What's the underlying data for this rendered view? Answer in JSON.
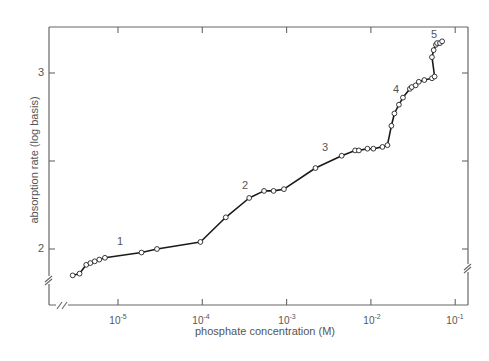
{
  "chart_data": {
    "type": "line",
    "title": "",
    "xlabel": "phosphate concentration (M)",
    "ylabel": "absorption rate (log basis)",
    "x_scale": "log",
    "x_ticks": [
      {
        "base": "10",
        "exp": "-5",
        "value": 1e-05
      },
      {
        "base": "10",
        "exp": "-4",
        "value": 0.0001
      },
      {
        "base": "10",
        "exp": "-3",
        "value": 0.001
      },
      {
        "base": "10",
        "exp": "-2",
        "value": 0.01
      },
      {
        "base": "10",
        "exp": "-1",
        "value": 0.1
      }
    ],
    "y_ticks": [
      {
        "label": "2",
        "value": 2
      },
      {
        "label": "",
        "value": 2.5
      },
      {
        "label": "3",
        "value": 3
      }
    ],
    "xlim": [
      2.3e-06,
      0.13
    ],
    "ylim": [
      1.68,
      3.26
    ],
    "axis_breaks": [
      "x-axis near left origin",
      "y-axis near bottom (left)",
      "y-axis near bottom (right)"
    ],
    "grid": false,
    "legend": null,
    "region_labels": [
      {
        "label": "1",
        "x": 1e-05,
        "y": 2.04
      },
      {
        "label": "2",
        "x": 0.00034,
        "y": 2.36
      },
      {
        "label": "3",
        "x": 0.0038,
        "y": 2.58
      },
      {
        "label": "4",
        "x": 0.026,
        "y": 2.91
      },
      {
        "label": "5",
        "x": 0.057,
        "y": 3.24
      }
    ],
    "series": [
      {
        "name": "absorption rate",
        "marker": "open circle",
        "points": [
          {
            "x": 2.9e-06,
            "y": 1.85
          },
          {
            "x": 3.5e-06,
            "y": 1.86
          },
          {
            "x": 4.2e-06,
            "y": 1.91
          },
          {
            "x": 4.7e-06,
            "y": 1.92
          },
          {
            "x": 5.3e-06,
            "y": 1.93
          },
          {
            "x": 6e-06,
            "y": 1.94
          },
          {
            "x": 7e-06,
            "y": 1.95
          },
          {
            "x": 1.9e-05,
            "y": 1.98
          },
          {
            "x": 2.9e-05,
            "y": 2.0
          },
          {
            "x": 9.5e-05,
            "y": 2.04
          },
          {
            "x": 0.00019,
            "y": 2.18
          },
          {
            "x": 0.00036,
            "y": 2.29
          },
          {
            "x": 0.00054,
            "y": 2.33
          },
          {
            "x": 0.0007,
            "y": 2.33
          },
          {
            "x": 0.00093,
            "y": 2.34
          },
          {
            "x": 0.0022,
            "y": 2.46
          },
          {
            "x": 0.0045,
            "y": 2.53
          },
          {
            "x": 0.0065,
            "y": 2.56
          },
          {
            "x": 0.0072,
            "y": 2.56
          },
          {
            "x": 0.0091,
            "y": 2.57
          },
          {
            "x": 0.0107,
            "y": 2.57
          },
          {
            "x": 0.0137,
            "y": 2.58
          },
          {
            "x": 0.0157,
            "y": 2.59
          },
          {
            "x": 0.0175,
            "y": 2.7
          },
          {
            "x": 0.019,
            "y": 2.77
          },
          {
            "x": 0.0215,
            "y": 2.82
          },
          {
            "x": 0.024,
            "y": 2.86
          },
          {
            "x": 0.029,
            "y": 2.91
          },
          {
            "x": 0.0305,
            "y": 2.92
          },
          {
            "x": 0.034,
            "y": 2.93
          },
          {
            "x": 0.037,
            "y": 2.95
          },
          {
            "x": 0.043,
            "y": 2.96
          },
          {
            "x": 0.053,
            "y": 2.97
          },
          {
            "x": 0.057,
            "y": 2.98
          },
          {
            "x": 0.053,
            "y": 3.09
          },
          {
            "x": 0.0555,
            "y": 3.13
          },
          {
            "x": 0.059,
            "y": 3.16
          },
          {
            "x": 0.061,
            "y": 3.17
          },
          {
            "x": 0.066,
            "y": 3.17
          },
          {
            "x": 0.07,
            "y": 3.18
          }
        ]
      }
    ]
  }
}
